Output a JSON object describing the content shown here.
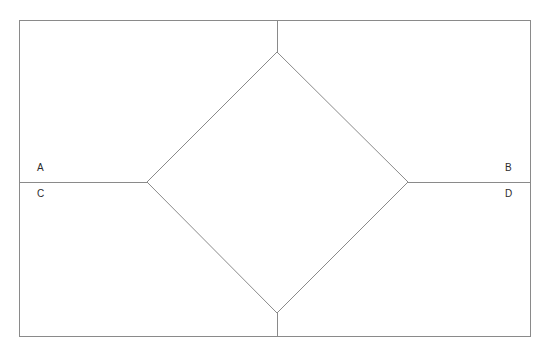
{
  "figure": {
    "background_color": "#ffffff",
    "stroke_color": "#8a8a8a",
    "stroke_width": 1,
    "label_color": "#2b2b2b",
    "canvas": {
      "width": 548,
      "height": 355
    },
    "rectangle": {
      "name": "outer-rectangle",
      "x": 19,
      "y": 20,
      "width": 512,
      "height": 317
    },
    "diamond": {
      "name": "inner-square-rotated",
      "top": {
        "x": 277,
        "y": 52
      },
      "right": {
        "x": 408,
        "y": 182
      },
      "bottom": {
        "x": 277,
        "y": 313
      },
      "left": {
        "x": 147,
        "y": 182
      }
    },
    "segments": [
      {
        "name": "top-stem",
        "x1": 277,
        "y1": 20,
        "x2": 277,
        "y2": 52
      },
      {
        "name": "bottom-stem",
        "x1": 277,
        "y1": 313,
        "x2": 277,
        "y2": 337
      },
      {
        "name": "left-ray",
        "x1": 19,
        "y1": 182,
        "x2": 147,
        "y2": 182
      },
      {
        "name": "right-ray",
        "x1": 408,
        "y1": 182,
        "x2": 531,
        "y2": 182
      }
    ],
    "labels": {
      "a": "A",
      "b": "B",
      "c": "C",
      "d": "D"
    }
  }
}
